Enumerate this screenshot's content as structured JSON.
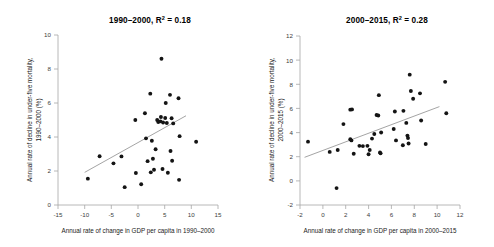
{
  "figure": {
    "background": "#ffffff",
    "point_color": "#141414",
    "axis_color": "#a6a6a6",
    "trend_color": "#9a9a9a"
  },
  "chart_data": [
    {
      "type": "scatter",
      "panel": "left",
      "title": "1990–2000, R² = 0.18",
      "title_prefix": "1990–2000, R",
      "title_sup": "2",
      "title_suffix": " = 0.18",
      "r_squared": 0.18,
      "xlabel": "Annual rate of change in GDP per capita in 1990–2000",
      "ylabel_line1": "Annual rate of decline in under-five mortality,",
      "ylabel_line2": "1990–2000 (%)",
      "xlim": [
        -15,
        15
      ],
      "ylim": [
        0,
        10
      ],
      "xticks": [
        -15,
        -10,
        -5,
        0,
        5,
        10,
        15
      ],
      "yticks": [
        0,
        2,
        4,
        6,
        8,
        10
      ],
      "grid": false,
      "legend": "none",
      "trend": {
        "x0": -10.0,
        "y0": 1.92,
        "x1": 9.0,
        "y1": 5.25
      },
      "points": [
        [
          -9.4,
          1.55
        ],
        [
          -7.2,
          2.87
        ],
        [
          -4.6,
          2.45
        ],
        [
          -3.1,
          2.86
        ],
        [
          -2.5,
          1.05
        ],
        [
          -0.5,
          5.0
        ],
        [
          -0.4,
          1.88
        ],
        [
          0.6,
          1.22
        ],
        [
          1.3,
          5.4
        ],
        [
          1.5,
          3.92
        ],
        [
          1.8,
          2.58
        ],
        [
          2.3,
          6.55
        ],
        [
          2.4,
          1.92
        ],
        [
          2.6,
          3.78
        ],
        [
          2.8,
          2.72
        ],
        [
          3.0,
          2.07
        ],
        [
          3.3,
          3.28
        ],
        [
          3.6,
          5.0
        ],
        [
          3.8,
          4.88
        ],
        [
          4.2,
          4.92
        ],
        [
          4.3,
          5.18
        ],
        [
          4.4,
          8.6
        ],
        [
          4.6,
          2.12
        ],
        [
          4.7,
          4.85
        ],
        [
          5.1,
          5.12
        ],
        [
          5.2,
          6.0
        ],
        [
          5.4,
          4.82
        ],
        [
          5.6,
          1.9
        ],
        [
          6.0,
          6.48
        ],
        [
          6.1,
          3.18
        ],
        [
          6.3,
          5.1
        ],
        [
          6.4,
          2.6
        ],
        [
          6.6,
          4.8
        ],
        [
          7.6,
          6.28
        ],
        [
          7.7,
          1.48
        ],
        [
          7.8,
          4.05
        ],
        [
          10.9,
          3.72
        ]
      ]
    },
    {
      "type": "scatter",
      "panel": "right",
      "title": "2000–2015, R² = 0.28",
      "title_prefix": "2000–2015, R",
      "title_sup": "2",
      "title_suffix": " = 0.28",
      "r_squared": 0.28,
      "xlabel": "Annual rate of change in GDP per capita in 2000–2015",
      "ylabel_line1": "Annual rate of decline in under-five mortality,",
      "ylabel_line2": "2000–2015 (%)",
      "xlim": [
        -2,
        12
      ],
      "ylim": [
        -2,
        12
      ],
      "xticks": [
        -2,
        0,
        2,
        4,
        6,
        8,
        10,
        12
      ],
      "yticks": [
        -2,
        0,
        2,
        4,
        6,
        8,
        10,
        12
      ],
      "grid": false,
      "legend": "none",
      "trend": {
        "x0": -1.6,
        "y0": 1.95,
        "x1": 10.2,
        "y1": 6.15
      },
      "points": [
        [
          -1.3,
          3.25
        ],
        [
          0.6,
          2.4
        ],
        [
          1.2,
          -0.6
        ],
        [
          1.3,
          2.55
        ],
        [
          1.8,
          4.7
        ],
        [
          2.4,
          5.9
        ],
        [
          2.55,
          5.92
        ],
        [
          2.4,
          3.45
        ],
        [
          2.5,
          3.35
        ],
        [
          2.7,
          2.25
        ],
        [
          3.2,
          2.9
        ],
        [
          3.5,
          2.88
        ],
        [
          3.9,
          2.9
        ],
        [
          4.0,
          2.2
        ],
        [
          4.1,
          2.55
        ],
        [
          4.3,
          3.5
        ],
        [
          4.5,
          3.88
        ],
        [
          4.7,
          5.45
        ],
        [
          4.85,
          5.42
        ],
        [
          4.9,
          7.1
        ],
        [
          5.0,
          2.35
        ],
        [
          5.05,
          2.28
        ],
        [
          5.1,
          4.0
        ],
        [
          6.2,
          4.3
        ],
        [
          6.3,
          5.75
        ],
        [
          6.4,
          3.35
        ],
        [
          7.0,
          2.95
        ],
        [
          7.05,
          5.8
        ],
        [
          7.3,
          4.8
        ],
        [
          7.4,
          3.75
        ],
        [
          7.45,
          3.55
        ],
        [
          7.5,
          3.1
        ],
        [
          7.6,
          8.8
        ],
        [
          7.7,
          7.45
        ],
        [
          7.9,
          6.8
        ],
        [
          8.5,
          7.25
        ],
        [
          8.6,
          5.0
        ],
        [
          9.0,
          3.05
        ],
        [
          10.7,
          8.2
        ],
        [
          10.8,
          5.6
        ]
      ]
    }
  ]
}
